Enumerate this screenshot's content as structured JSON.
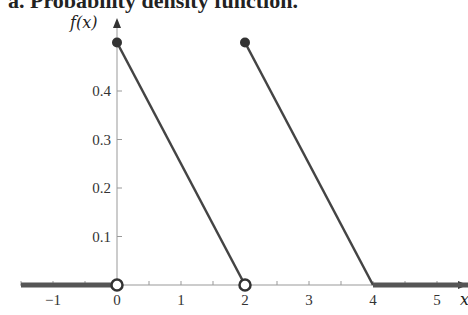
{
  "title": "a. Probability density function.",
  "chart_data": {
    "type": "line",
    "title": "a. Probability density function.",
    "xlabel": "x",
    "ylabel": "f(x)",
    "xlim": [
      -1.5,
      5.5
    ],
    "ylim": [
      0,
      0.5
    ],
    "xticks": [
      "-1",
      "0",
      "1",
      "2",
      "3",
      "4",
      "5"
    ],
    "yticks": [
      "0.1",
      "0.2",
      "0.3",
      "0.4"
    ],
    "grid": false,
    "segments": [
      {
        "x": [
          -1.5,
          0
        ],
        "y": [
          0,
          0
        ],
        "end": "open"
      },
      {
        "x": [
          0,
          2
        ],
        "y": [
          0.5,
          0
        ],
        "start": "closed",
        "end": "open"
      },
      {
        "x": [
          2,
          4
        ],
        "y": [
          0.5,
          0
        ],
        "start": "closed"
      },
      {
        "x": [
          4,
          5.5
        ],
        "y": [
          0,
          0
        ]
      }
    ]
  },
  "colors": {
    "line": "#444444",
    "axis": "#999999",
    "thick": "#555555"
  }
}
